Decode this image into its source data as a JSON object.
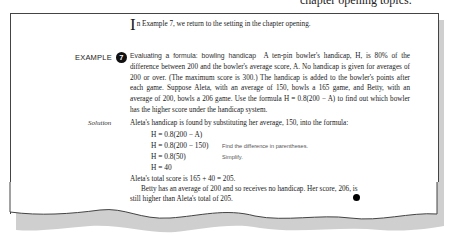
{
  "page_header_fragment": "chapter opening topics.",
  "intro": {
    "dropcap": "I",
    "text": "n Example 7, we return to the setting in the chapter opening."
  },
  "example": {
    "label": "EXAMPLE",
    "number": "7",
    "topic": "Evaluating a formula: bowling handicap",
    "problem_lines": [
      "A ten-pin bowler's handicap, H, is 80% of",
      "the difference between 200 and the bowler's average score, A. No handicap is",
      "given for averages of 200 or over. (The maximum score is 300.) The handicap is",
      "added to the bowler's points after each game. Suppose Aleta, with an average of",
      "150, bowls a 165 game, and Betty, with an average of 200, bowls a 206 game. Use",
      "the formula H = 0.8(200 − A) to find out which bowler has the higher score",
      "under the handicap system."
    ]
  },
  "solution": {
    "label": "Solution",
    "intro": "Aleta's handicap is found by substituting her average, 150, into the formula:",
    "steps": [
      {
        "equation": "H = 0.8(200 − A)",
        "note": ""
      },
      {
        "equation": "H = 0.8(200 − 150)",
        "note": "Find the difference in parentheses."
      },
      {
        "equation": "H = 0.8(50)",
        "note": "Simplify."
      },
      {
        "equation": "H = 40",
        "note": ""
      }
    ],
    "total_line": "Aleta's total score is 165 + 40 = 205.",
    "conclusion_lines": [
      "Betty has an average of 200 and so receives no handicap. Her score, 206, is",
      "still higher than Aleta's total of 205."
    ]
  }
}
